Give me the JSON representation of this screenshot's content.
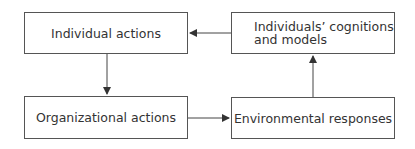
{
  "diagram": {
    "nodes": [
      {
        "id": "individual-actions",
        "label": "Individual actions"
      },
      {
        "id": "individuals-cognitions",
        "label_line1": "Individuals’ cognitions",
        "label_line2": "and models"
      },
      {
        "id": "organizational-actions",
        "label": "Organizational actions"
      },
      {
        "id": "environmental-responses",
        "label": "Environmental responses"
      }
    ],
    "edges": [
      {
        "from": "individual-actions",
        "to": "organizational-actions"
      },
      {
        "from": "organizational-actions",
        "to": "environmental-responses"
      },
      {
        "from": "environmental-responses",
        "to": "individuals-cognitions"
      },
      {
        "from": "individuals-cognitions",
        "to": "individual-actions"
      }
    ],
    "colors": {
      "line": "#444444",
      "text": "#333333",
      "border": "#555555"
    }
  }
}
